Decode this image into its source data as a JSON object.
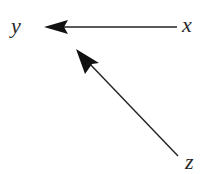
{
  "diagram": {
    "type": "directed-graph",
    "nodes": [
      {
        "id": "y",
        "label": "y"
      },
      {
        "id": "x",
        "label": "x"
      },
      {
        "id": "z",
        "label": "z"
      }
    ],
    "edges": [
      {
        "from": "x",
        "to": "y"
      },
      {
        "from": "z",
        "to": "y"
      }
    ],
    "colors": {
      "line": "#222222",
      "label": "#2a2a2a",
      "background": "#ffffff"
    }
  }
}
